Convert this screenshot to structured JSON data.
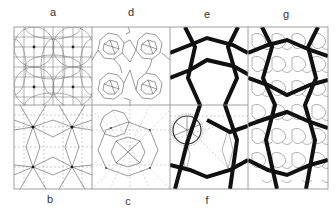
{
  "figure": {
    "panels": [
      {
        "id": "a",
        "label": "a",
        "content": "square grid with intersecting circular arcs around nodes"
      },
      {
        "id": "b",
        "label": "b",
        "content": "grid with star-shaped construction lines and dashed guides"
      },
      {
        "id": "c",
        "label": "c",
        "content": "polygon construction with dashed guides"
      },
      {
        "id": "d",
        "label": "d",
        "content": "interlaced rosette pattern"
      },
      {
        "id": "e",
        "label": "e",
        "content": "bold zigzag strapwork"
      },
      {
        "id": "f",
        "label": "f",
        "content": "bold strapwork with construction circle"
      },
      {
        "id": "g",
        "label": "g",
        "content": "bold strapwork overlaid on fine rosette pattern"
      }
    ]
  },
  "labels": {
    "a": "a",
    "b": "b",
    "c": "c",
    "d": "d",
    "e": "e",
    "f": "f",
    "g": "g"
  },
  "colors": {
    "line": "#555555",
    "bold": "#111111",
    "frame": "#888888"
  }
}
